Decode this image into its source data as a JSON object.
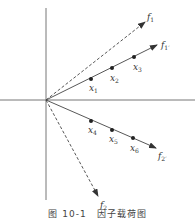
{
  "diagram": {
    "type": "factor-loading-vector-diagram",
    "caption": "图 10-1　因子载荷图",
    "axes": {
      "horizontal": true,
      "vertical": true
    },
    "vectors": [
      {
        "label": "f",
        "sub": "1",
        "prime": false,
        "style": "dashed"
      },
      {
        "label": "f",
        "sub": "1",
        "prime": true,
        "style": "solid"
      },
      {
        "label": "f",
        "sub": "2",
        "prime": true,
        "style": "solid"
      },
      {
        "label": "f",
        "sub": "2",
        "prime": false,
        "style": "dashed"
      }
    ],
    "points": [
      {
        "label": "x",
        "sub": "1",
        "on": "f1'"
      },
      {
        "label": "x",
        "sub": "2",
        "on": "f1'"
      },
      {
        "label": "x",
        "sub": "3",
        "on": "f1'"
      },
      {
        "label": "x",
        "sub": "4",
        "on": "f2'"
      },
      {
        "label": "x",
        "sub": "5",
        "on": "f2'"
      },
      {
        "label": "x",
        "sub": "6",
        "on": "f2'"
      }
    ],
    "labels": {
      "f1": "f",
      "f1_sub": "1",
      "f1p": "f",
      "f1p_sub": "1′",
      "f2p": "f",
      "f2p_sub": "2′",
      "f2": "f",
      "f2_sub": "2",
      "x1": "x",
      "x1_sub": "1",
      "x2": "x",
      "x2_sub": "2",
      "x3": "x",
      "x3_sub": "3",
      "x4": "x",
      "x4_sub": "4",
      "x5": "x",
      "x5_sub": "5",
      "x6": "x",
      "x6_sub": "6"
    },
    "colors": {
      "line": "#444444",
      "axis": "#666666",
      "text": "#333333"
    }
  }
}
